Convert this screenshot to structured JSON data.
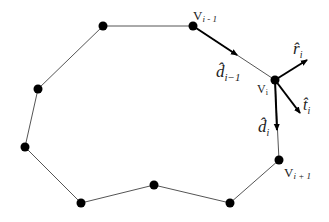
{
  "diagram": {
    "type": "polygon-contour",
    "vertices": [
      {
        "x": 103,
        "y": 26
      },
      {
        "x": 193,
        "y": 26,
        "label": "V",
        "sub": "i-1"
      },
      {
        "x": 275,
        "y": 80,
        "label": "V",
        "sub": "i"
      },
      {
        "x": 279,
        "y": 160,
        "label": "V",
        "sub": "i+1"
      },
      {
        "x": 230,
        "y": 203
      },
      {
        "x": 154,
        "y": 185
      },
      {
        "x": 81,
        "y": 203
      },
      {
        "x": 25,
        "y": 147
      },
      {
        "x": 38,
        "y": 89
      }
    ],
    "labels": {
      "v_prev": {
        "main": "V",
        "sub": "i - 1"
      },
      "v_cur": {
        "main": "V",
        "sub": "i"
      },
      "v_next": {
        "main": "V",
        "sub": "i + 1"
      },
      "d_prev": {
        "main": "d̂",
        "sub": "i−1"
      },
      "d_cur": {
        "main": "d̂",
        "sub": "i"
      },
      "r_cur": {
        "main": "r̂",
        "sub": "i"
      },
      "t_cur": {
        "main": "t̂",
        "sub": "i"
      }
    },
    "vectors": [
      {
        "name": "d_prev",
        "from": [
          193,
          26
        ],
        "to": [
          237,
          55
        ]
      },
      {
        "name": "r_i",
        "from": [
          275,
          80
        ],
        "to": [
          307,
          60
        ]
      },
      {
        "name": "t_i",
        "from": [
          275,
          80
        ],
        "to": [
          300,
          113
        ]
      },
      {
        "name": "d_i",
        "from": [
          275,
          80
        ],
        "to": [
          277,
          130
        ]
      }
    ],
    "colors": {
      "line": "#555555",
      "node": "#000000",
      "arrow": "#000000"
    }
  }
}
